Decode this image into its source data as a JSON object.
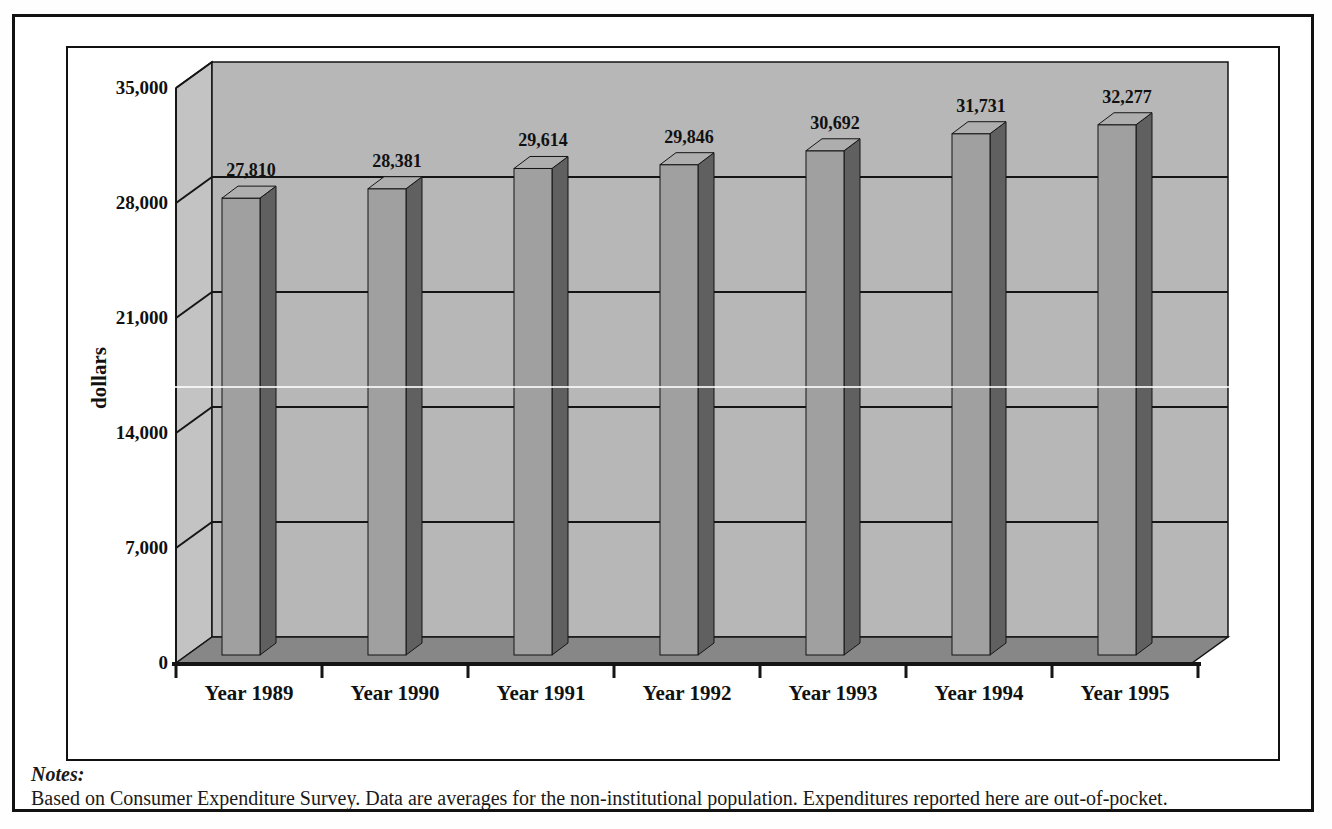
{
  "notes": {
    "label": "Notes:",
    "text": "Based on Consumer Expenditure Survey. Data are averages for the non-institutional population. Expenditures reported here are out-of-pocket."
  },
  "chart_data": {
    "type": "bar",
    "style": "3d-column",
    "title": "",
    "xlabel": "",
    "ylabel": "dollars",
    "categories": [
      "Year 1989",
      "Year 1990",
      "Year 1991",
      "Year 1992",
      "Year 1993",
      "Year 1994",
      "Year 1995"
    ],
    "values": [
      27810,
      28381,
      29614,
      29846,
      30692,
      31731,
      32277
    ],
    "value_labels": [
      "27,810",
      "28,381",
      "29,614",
      "29,846",
      "30,692",
      "31,731",
      "32,277"
    ],
    "ylim": [
      0,
      35000
    ],
    "yticks": [
      0,
      7000,
      14000,
      21000,
      28000,
      35000
    ],
    "ytick_labels": [
      "0",
      "7,000",
      "14,000",
      "21,000",
      "28,000",
      "35,000"
    ],
    "grid": true,
    "legend": false,
    "colors": {
      "wall_back": "#b7b7b7",
      "wall_left": "#c3c3c3",
      "floor": "#878787",
      "bar_front": "#a0a0a0",
      "bar_side": "#606060",
      "bar_top": "#aeaeae",
      "line": "#151515"
    }
  }
}
